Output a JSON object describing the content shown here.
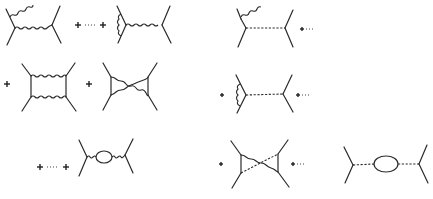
{
  "figure": {
    "left_column": {
      "rows": [
        {
          "items": [
            "bremsstrahlung-exchange",
            "plus",
            "ellipsis",
            "plus",
            "vertex-correction-exchange"
          ]
        },
        {
          "items": [
            "plus",
            "box-diagram",
            "plus",
            "crossed-box-diagram"
          ]
        },
        {
          "items": [
            "plus",
            "ellipsis",
            "plus",
            "vacuum-polarization-exchange"
          ]
        }
      ]
    },
    "right_column": {
      "rows": [
        {
          "items": [
            "bremsstrahlung-dashed-exchange",
            "plus",
            "ellipsis"
          ]
        },
        {
          "items": [
            "plus",
            "vertex-correction-dashed-exchange",
            "plus",
            "ellipsis"
          ]
        },
        {
          "items": [
            "plus",
            "crossed-mixed-box",
            "plus",
            "ellipsis",
            "vacuum-polarization-dashed-exchange"
          ]
        }
      ]
    },
    "symbols": {
      "plus": "+",
      "ellipsis": "…"
    },
    "colors": {
      "line": "#2a2a2a",
      "background": "#ffffff"
    }
  }
}
